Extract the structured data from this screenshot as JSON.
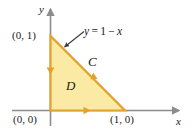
{
  "figure": {
    "type": "math-diagram",
    "background_color": "#ffffff",
    "axes": {
      "color": "#8c8c8c",
      "x_axis_label": "x",
      "y_axis_label": "y",
      "x_axis_arrow": "arrow-right",
      "y_axis_arrow": "arrow-up"
    },
    "region": {
      "label": "D",
      "fill_color": "#fbeaa3",
      "stroke_color": "#e2a22e",
      "vertices": [
        {
          "label": "(0, 1)",
          "x": 0,
          "y": 1
        },
        {
          "label": "(0, 0)",
          "x": 0,
          "y": 0
        },
        {
          "label": "(1, 0)",
          "x": 1,
          "y": 0
        }
      ]
    },
    "curve": {
      "label": "C",
      "orientation": "counterclockwise",
      "orientation_markers": [
        "arrow-down-left-edge",
        "arrow-right-bottom-edge",
        "arrow-upleft-hypotenuse"
      ]
    },
    "annotation": {
      "equation": "y = 1 − x",
      "equation_parts": {
        "lhs": "y",
        "equals": "=",
        "rhs_one": "1",
        "minus": "−",
        "rhs_var": "x"
      },
      "leader": "arrow-to-hypotenuse"
    },
    "point_labels": {
      "origin": "(0, 0)",
      "y_intercept": "(0, 1)",
      "x_intercept": "(1, 0)"
    }
  }
}
